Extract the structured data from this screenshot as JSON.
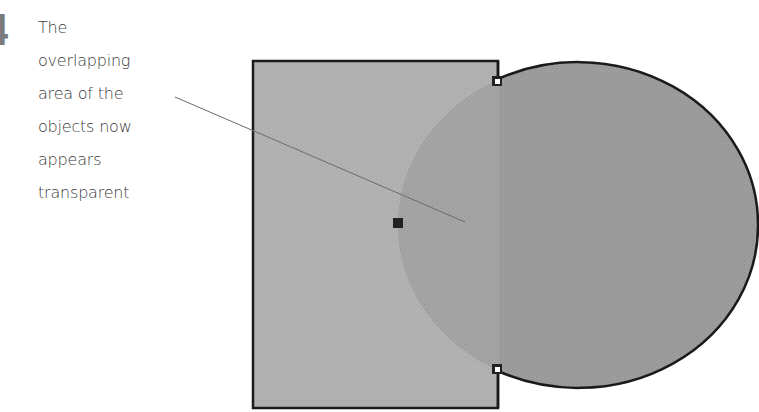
{
  "step": {
    "number": "4",
    "caption_lines": [
      "The",
      "overlapping",
      "area of the",
      "objects now",
      "appears",
      "transparent"
    ]
  },
  "figure": {
    "rectangle": {
      "x": 252,
      "y": 60,
      "width": 247,
      "height": 349,
      "fill": "#b0b0b0",
      "stroke": "#1a1a1a"
    },
    "ellipse": {
      "cx": 578,
      "cy": 225,
      "rx": 180,
      "ry": 162,
      "fill": "#9a9a9a",
      "stroke": "#1a1a1a",
      "opacity": 0.85
    },
    "overlap_fill": "#a2a2a2",
    "leader_line": {
      "x1": 175,
      "y1": 97,
      "x2": 465,
      "y2": 222,
      "color": "#6a6a6a"
    },
    "handles": [
      {
        "name": "center-handle",
        "x": 393,
        "y": 218,
        "size": 10,
        "color": "#222222"
      },
      {
        "name": "top-right-handle",
        "x": 493,
        "y": 77,
        "size": 9,
        "color": "#222222"
      },
      {
        "name": "bottom-right-handle",
        "x": 493,
        "y": 365,
        "size": 9,
        "color": "#222222"
      }
    ]
  }
}
